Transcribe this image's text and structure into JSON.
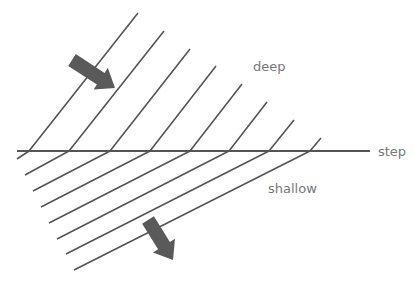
{
  "diagram": {
    "labels": {
      "deep": "deep",
      "shallow": "shallow",
      "step": "step"
    },
    "colors": {
      "line": "#555555",
      "arrow": "#5a5a5a",
      "text": "#777777",
      "background": "#ffffff"
    },
    "step_line": {
      "x1": 17,
      "y1": 151,
      "x2": 370,
      "y2": 151
    },
    "wavefronts": [
      {
        "top": [
          138,
          13
        ],
        "bend": [
          29,
          151
        ],
        "end": [
          17,
          159
        ]
      },
      {
        "top": [
          164,
          31
        ],
        "bend": [
          69,
          151
        ],
        "end": [
          25,
          175
        ]
      },
      {
        "top": [
          190,
          49
        ],
        "bend": [
          110,
          151
        ],
        "end": [
          33,
          191
        ]
      },
      {
        "top": [
          216,
          66
        ],
        "bend": [
          150,
          151
        ],
        "end": [
          41,
          207
        ]
      },
      {
        "top": [
          242,
          84
        ],
        "bend": [
          190,
          151
        ],
        "end": [
          49,
          223
        ]
      },
      {
        "top": [
          267,
          102
        ],
        "bend": [
          229,
          151
        ],
        "end": [
          57,
          239
        ]
      },
      {
        "top": [
          294,
          120
        ],
        "bend": [
          269,
          151
        ],
        "end": [
          66,
          254
        ]
      },
      {
        "top": [
          321,
          138
        ],
        "bend": [
          310,
          151
        ],
        "end": [
          74,
          270
        ]
      }
    ],
    "arrows": [
      {
        "name": "deep-propagation-arrow",
        "from": [
          72,
          60
        ],
        "to": [
          115,
          88
        ]
      },
      {
        "name": "shallow-propagation-arrow",
        "from": [
          148,
          220
        ],
        "to": [
          173,
          260
        ]
      }
    ]
  }
}
